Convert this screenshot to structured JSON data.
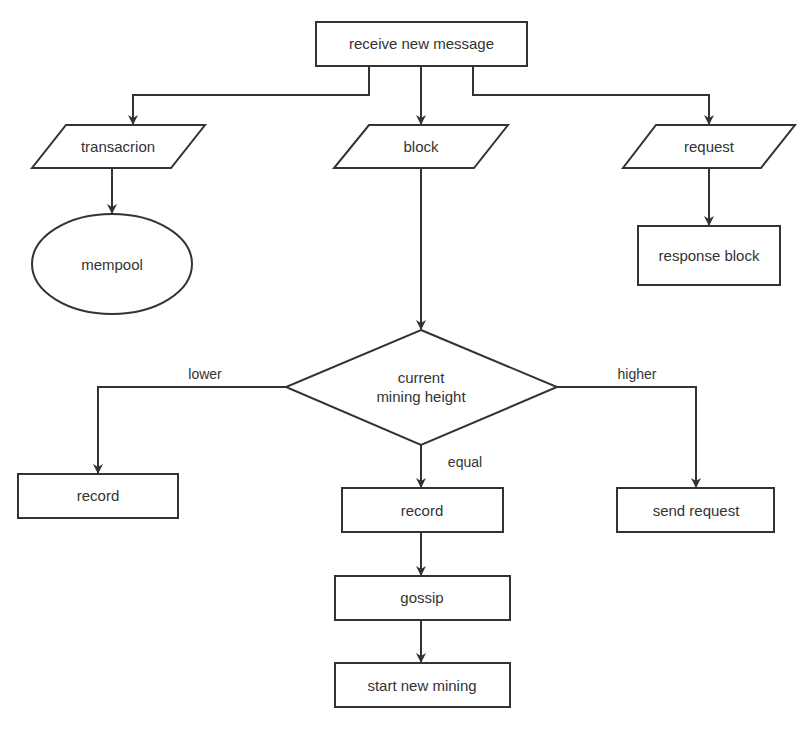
{
  "diagram": {
    "type": "flowchart",
    "nodes": {
      "receive": {
        "label": "receive new message",
        "shape": "rectangle"
      },
      "transaction": {
        "label": "transacrion",
        "shape": "parallelogram"
      },
      "block": {
        "label": "block",
        "shape": "parallelogram"
      },
      "request": {
        "label": "request",
        "shape": "parallelogram"
      },
      "mempool": {
        "label": "mempool",
        "shape": "ellipse"
      },
      "response_block": {
        "label": "response block",
        "shape": "rectangle"
      },
      "decision": {
        "label_line1": "current",
        "label_line2": "mining height",
        "shape": "diamond"
      },
      "record_lower": {
        "label": "record",
        "shape": "rectangle"
      },
      "record_equal": {
        "label": "record",
        "shape": "rectangle"
      },
      "send_request": {
        "label": "send request",
        "shape": "rectangle"
      },
      "gossip": {
        "label": "gossip",
        "shape": "rectangle"
      },
      "start_mining": {
        "label": "start new mining",
        "shape": "rectangle"
      }
    },
    "edge_labels": {
      "lower": "lower",
      "equal": "equal",
      "higher": "higher"
    },
    "edges": [
      {
        "from": "receive",
        "to": "transaction"
      },
      {
        "from": "receive",
        "to": "block"
      },
      {
        "from": "receive",
        "to": "request"
      },
      {
        "from": "transaction",
        "to": "mempool"
      },
      {
        "from": "request",
        "to": "response_block"
      },
      {
        "from": "block",
        "to": "decision"
      },
      {
        "from": "decision",
        "to": "record_lower",
        "label": "lower"
      },
      {
        "from": "decision",
        "to": "record_equal",
        "label": "equal"
      },
      {
        "from": "decision",
        "to": "send_request",
        "label": "higher"
      },
      {
        "from": "record_equal",
        "to": "gossip"
      },
      {
        "from": "gossip",
        "to": "start_mining"
      }
    ]
  }
}
